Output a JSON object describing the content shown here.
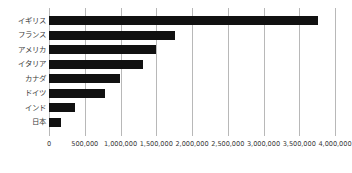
{
  "chart_data": {
    "type": "bar",
    "orientation": "horizontal",
    "title": "",
    "subtitle": "",
    "xlabel": "",
    "ylabel": "",
    "categories": [
      "イギリス",
      "フランス",
      "アメリカ",
      "イタリア",
      "カナダ",
      "ドイツ",
      "インド",
      "日本"
    ],
    "values": [
      3760000,
      1760000,
      1500000,
      1310000,
      990000,
      780000,
      360000,
      170000
    ],
    "series": [
      {
        "name": "",
        "values": [
          3760000,
          1760000,
          1500000,
          1310000,
          990000,
          780000,
          360000,
          170000
        ]
      }
    ],
    "xlim": [
      0,
      4000000
    ],
    "xticks": [
      0,
      500000,
      1000000,
      1500000,
      2000000,
      2500000,
      3000000,
      3500000,
      4000000
    ],
    "xtick_labels": [
      "0",
      "500,000",
      "1,000,000",
      "1,500,000",
      "2,000,000",
      "2,500,000",
      "3,000,000",
      "3,500,000",
      "4,000,000"
    ],
    "grid": "vertical",
    "legend": "none",
    "bar_color": "#111111",
    "gridline_color": "#b8b8b8",
    "text_color": "#3a3a3a",
    "background_color": "#ffffff",
    "annotations": []
  }
}
